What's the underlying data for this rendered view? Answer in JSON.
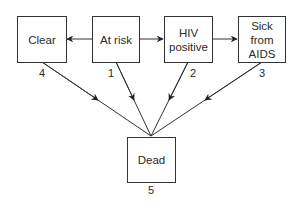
{
  "diagram": {
    "states": [
      {
        "id": 4,
        "label": "Clear",
        "number": "4"
      },
      {
        "id": 1,
        "label": "At risk",
        "number": "1"
      },
      {
        "id": 2,
        "label": "HIV positive",
        "number": "2"
      },
      {
        "id": 3,
        "label": "Sick from AIDS",
        "number": "3"
      },
      {
        "id": 5,
        "label": "Dead",
        "number": "5"
      }
    ],
    "labels": {
      "clear": "Clear",
      "at_risk": "At risk",
      "hiv_line1": "HIV",
      "hiv_line2": "positive",
      "sick_line1": "Sick",
      "sick_line2": "from",
      "sick_line3": "AIDS",
      "dead": "Dead"
    },
    "numbers": {
      "clear": "4",
      "at_risk": "1",
      "hiv": "2",
      "sick": "3",
      "dead": "5"
    },
    "transitions": [
      {
        "from": "At risk",
        "to": "Clear"
      },
      {
        "from": "At risk",
        "to": "HIV positive"
      },
      {
        "from": "HIV positive",
        "to": "Sick from AIDS"
      },
      {
        "from": "Clear",
        "to": "Dead"
      },
      {
        "from": "At risk",
        "to": "Dead"
      },
      {
        "from": "HIV positive",
        "to": "Dead"
      },
      {
        "from": "Sick from AIDS",
        "to": "Dead"
      }
    ],
    "colors": {
      "line": "#333333",
      "box_border": "#333333",
      "background": "#ffffff"
    }
  }
}
